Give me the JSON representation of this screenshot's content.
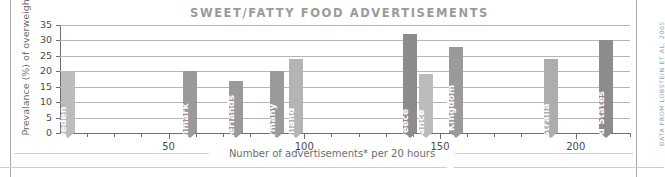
{
  "chart_data": {
    "type": "bar",
    "title": "SWEET/FATTY FOOD ADVERTISEMENTS",
    "xlabel": "Number of advertisements* per 20 hours",
    "ylabel": "Prevalance (%) of overweight",
    "source_credit": "DATA FROM LOBSTEIN ET AL, 2005",
    "xlim": [
      10,
      220
    ],
    "ylim": [
      0,
      35
    ],
    "xticks": [
      50,
      100,
      150,
      200
    ],
    "xtick_labels": [
      "50",
      "100",
      "150",
      "200"
    ],
    "xminor_step": 10,
    "yticks": [
      0,
      5,
      10,
      15,
      20,
      25,
      30,
      35
    ],
    "ytick_labels": [
      "0",
      "5",
      "10",
      "15",
      "20",
      "25",
      "30",
      "35"
    ],
    "grid": "horizontal",
    "legend": "none",
    "categories": [
      "Sweden",
      "Denmark",
      "Netherlands",
      "Germany",
      "Finland",
      "Greece",
      "France",
      "United Kingdom",
      "Australia",
      "United States"
    ],
    "x": [
      13,
      58,
      75,
      90,
      97,
      139,
      145,
      156,
      191,
      211
    ],
    "values": [
      20,
      20,
      17,
      20,
      24,
      32,
      19,
      28,
      24,
      30
    ],
    "bar_colors": [
      "#bcbcbc",
      "#9a9a9a",
      "#9a9a9a",
      "#9a9a9a",
      "#b4b4b4",
      "#8c8c8c",
      "#bcbcbc",
      "#9a9a9a",
      "#adadad",
      "#8c8c8c"
    ]
  }
}
